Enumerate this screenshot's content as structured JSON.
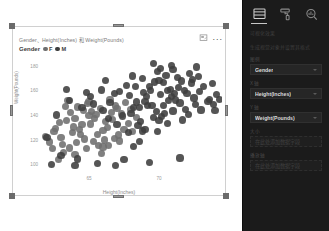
{
  "visual": {
    "title": "Gender、Height(Inches) 和 Weight(Pounds)",
    "focus_icon": "focus-mode-icon",
    "more_icon": "more-options-icon",
    "more_label": "...",
    "legend": {
      "title": "Gender",
      "items": [
        {
          "label": "F",
          "color": "#6e6e6e"
        },
        {
          "label": "M",
          "color": "#3d3d3d"
        }
      ]
    }
  },
  "chart_data": {
    "type": "scatter",
    "title": "Gender、Height(Inches) 和 Weight(Pounds)",
    "xlabel": "Height(Inches)",
    "ylabel": "Weight(Pounds)",
    "xticks": [
      65,
      70
    ],
    "yticks": [
      180,
      160,
      140,
      120,
      100
    ],
    "xlim": [
      61.5,
      74.5
    ],
    "ylim": [
      92,
      188
    ],
    "grid": false,
    "legend_position": "top-left",
    "series": [
      {
        "name": "F",
        "color": "#6e6e6e",
        "points": [
          [
            63.2,
            109.5
          ],
          [
            62.8,
            104.0
          ],
          [
            63.6,
            113.2
          ],
          [
            64.1,
            117.8
          ],
          [
            63.0,
            121.4
          ],
          [
            62.5,
            126.9
          ],
          [
            64.8,
            112.6
          ],
          [
            65.3,
            118.3
          ],
          [
            64.4,
            124.1
          ],
          [
            63.9,
            130.2
          ],
          [
            65.9,
            108.7
          ],
          [
            66.4,
            115.5
          ],
          [
            65.1,
            132.6
          ],
          [
            64.0,
            137.1
          ],
          [
            66.0,
            127.4
          ],
          [
            66.8,
            121.0
          ],
          [
            65.5,
            140.3
          ],
          [
            64.6,
            143.8
          ],
          [
            67.2,
            118.9
          ],
          [
            66.2,
            134.7
          ],
          [
            67.5,
            128.2
          ],
          [
            65.8,
            145.0
          ],
          [
            64.9,
            149.2
          ],
          [
            63.4,
            135.5
          ],
          [
            62.2,
            118.0
          ],
          [
            61.9,
            122.5
          ],
          [
            66.6,
            141.9
          ],
          [
            67.8,
            133.4
          ],
          [
            68.1,
            126.8
          ],
          [
            65.0,
            151.0
          ],
          [
            63.7,
            142.2
          ],
          [
            64.3,
            128.5
          ],
          [
            66.1,
            119.7
          ],
          [
            67.0,
            145.6
          ],
          [
            65.6,
            124.3
          ],
          [
            62.9,
            133.8
          ],
          [
            68.4,
            138.0
          ],
          [
            64.7,
            120.5
          ],
          [
            66.9,
            147.3
          ],
          [
            63.1,
            116.2
          ],
          [
            65.4,
            136.9
          ],
          [
            67.3,
            140.8
          ],
          [
            64.2,
            146.5
          ],
          [
            66.3,
            130.0
          ],
          [
            62.4,
            112.8
          ],
          [
            63.8,
            125.6
          ],
          [
            65.2,
            143.1
          ],
          [
            66.7,
            136.2
          ],
          [
            67.6,
            149.9
          ],
          [
            64.5,
            132.0
          ],
          [
            68.0,
            144.5
          ],
          [
            63.3,
            147.0
          ],
          [
            65.7,
            115.4
          ],
          [
            62.6,
            129.3
          ],
          [
            66.5,
            152.8
          ],
          [
            64.0,
            108.1
          ],
          [
            67.1,
            123.7
          ],
          [
            65.0,
            139.5
          ],
          [
            63.5,
            151.6
          ],
          [
            66.0,
            113.9
          ]
        ]
      },
      {
        "name": "M",
        "color": "#3d3d3d",
        "points": [
          [
            67.4,
            139.2
          ],
          [
            68.2,
            145.8
          ],
          [
            69.0,
            151.3
          ],
          [
            68.7,
            134.6
          ],
          [
            69.5,
            148.0
          ],
          [
            70.1,
            156.4
          ],
          [
            69.8,
            142.7
          ],
          [
            70.6,
            159.8
          ],
          [
            71.2,
            152.2
          ],
          [
            70.3,
            147.5
          ],
          [
            68.9,
            158.1
          ],
          [
            69.3,
            163.5
          ],
          [
            71.8,
            160.2
          ],
          [
            70.9,
            154.9
          ],
          [
            72.3,
            166.0
          ],
          [
            71.5,
            149.7
          ],
          [
            72.8,
            171.4
          ],
          [
            70.0,
            168.3
          ],
          [
            69.6,
            137.8
          ],
          [
            68.4,
            150.6
          ],
          [
            71.0,
            143.2
          ],
          [
            72.0,
            157.7
          ],
          [
            73.2,
            162.9
          ],
          [
            70.5,
            172.0
          ],
          [
            69.1,
            155.1
          ],
          [
            68.0,
            141.4
          ],
          [
            71.6,
            167.6
          ],
          [
            72.5,
            153.8
          ],
          [
            70.8,
            161.0
          ],
          [
            69.9,
            175.2
          ],
          [
            73.8,
            165.5
          ],
          [
            74.1,
            157.0
          ],
          [
            68.6,
            146.3
          ],
          [
            70.2,
            138.9
          ],
          [
            71.3,
            170.8
          ],
          [
            72.6,
            148.4
          ],
          [
            69.4,
            159.6
          ],
          [
            70.7,
            152.0
          ],
          [
            68.3,
            163.1
          ],
          [
            71.9,
            144.7
          ],
          [
            72.2,
            173.5
          ],
          [
            69.7,
            166.8
          ],
          [
            70.4,
            141.0
          ],
          [
            71.1,
            157.3
          ],
          [
            73.5,
            150.9
          ],
          [
            68.8,
            169.4
          ],
          [
            70.0,
            135.2
          ],
          [
            72.9,
            159.0
          ],
          [
            69.2,
            147.9
          ],
          [
            71.4,
            162.3
          ],
          [
            67.9,
            155.7
          ],
          [
            73.0,
            144.1
          ],
          [
            70.1,
            178.0
          ],
          [
            68.5,
            131.5
          ],
          [
            72.4,
            168.7
          ],
          [
            66.5,
            150.2
          ],
          [
            67.7,
            163.8
          ],
          [
            69.0,
            128.4
          ],
          [
            71.7,
            136.0
          ],
          [
            73.6,
            152.5
          ],
          [
            66.0,
            143.6
          ],
          [
            67.2,
            158.9
          ],
          [
            68.1,
            171.8
          ],
          [
            70.6,
            133.1
          ],
          [
            72.1,
            140.3
          ],
          [
            65.3,
            149.0
          ],
          [
            66.8,
            157.2
          ],
          [
            69.9,
            126.7
          ],
          [
            71.0,
            177.1
          ],
          [
            73.9,
            148.8
          ],
          [
            64.5,
            145.9
          ],
          [
            65.9,
            160.4
          ],
          [
            67.0,
            132.2
          ],
          [
            68.8,
            127.0
          ],
          [
            70.3,
            166.2
          ],
          [
            62.0,
            121.6
          ],
          [
            62.7,
            140.0
          ],
          [
            63.6,
            151.9
          ],
          [
            64.8,
            158.6
          ],
          [
            66.2,
            168.0
          ],
          [
            63.0,
            106.8
          ],
          [
            64.2,
            104.2
          ],
          [
            65.6,
            100.5
          ],
          [
            67.5,
            103.8
          ],
          [
            69.3,
            101.2
          ],
          [
            71.5,
            105.0
          ],
          [
            66.9,
            99.0
          ],
          [
            68.2,
            114.2
          ],
          [
            64.0,
            98.6
          ],
          [
            62.3,
            100.0
          ],
          [
            70.9,
            180.5
          ],
          [
            72.7,
            179.0
          ],
          [
            69.6,
            182.0
          ],
          [
            74.3,
            152.6
          ],
          [
            74.0,
            143.9
          ],
          [
            66.4,
            137.4
          ],
          [
            67.8,
            126.0
          ],
          [
            65.1,
            155.3
          ],
          [
            63.4,
            160.7
          ],
          [
            68.6,
            118.5
          ]
        ]
      }
    ]
  },
  "pane": {
    "tabs": [
      {
        "name": "fields-tab",
        "icon": "fields-icon",
        "active": true
      },
      {
        "name": "format-tab",
        "icon": "paint-roller-icon",
        "active": false
      },
      {
        "name": "analytics-tab",
        "icon": "analytics-magnifier-icon",
        "active": false
      }
    ],
    "sections": [
      {
        "kind": "text",
        "label": "可视化效果"
      },
      {
        "kind": "text",
        "label": "生成视觉对象并设置其格式"
      },
      {
        "kind": "label",
        "label": "图例"
      },
      {
        "kind": "well",
        "value": "Gender",
        "empty": false
      },
      {
        "kind": "label",
        "label": "X 轴"
      },
      {
        "kind": "well",
        "value": "Height(Inches)",
        "empty": false
      },
      {
        "kind": "label",
        "label": "Y 轴"
      },
      {
        "kind": "well",
        "value": "Weight(Pounds)",
        "empty": false
      },
      {
        "kind": "label",
        "label": "大小"
      },
      {
        "kind": "well",
        "value": "在此处添加数据字段",
        "empty": true
      },
      {
        "kind": "label",
        "label": "播放轴"
      },
      {
        "kind": "well",
        "value": "在此处添加数据字段",
        "empty": true
      }
    ]
  }
}
